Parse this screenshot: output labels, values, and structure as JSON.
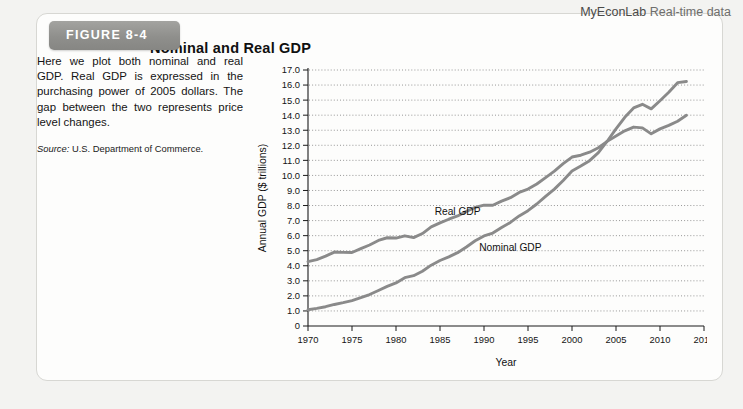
{
  "brand": {
    "name": "MyEconLab",
    "subtitle": "Real-time data"
  },
  "figure": {
    "badge_label": "FIGURE 8-4",
    "title": "Nominal and Real GDP",
    "caption": "Here we plot both nominal and real GDP. Real GDP is expressed in the purchasing power of 2005 dollars. The gap between the two represents price level changes.",
    "source_label": "Source:",
    "source_text": "U.S. Department of Commerce."
  },
  "ghost": {
    "line_a": "ttttttttttttt ttttttt tttttttt tttt ttttttt tttt ttttt ttttttt tttt tttttt",
    "line_b": "tttttt ttttt tt tttt ttttttt ttttt tttttttt tttt ttt tttttt ttttttt ttttt ttt tttt",
    "line_c": "Foreign Exchange Rates"
  },
  "chart_data": {
    "type": "line",
    "title": "Nominal and Real GDP",
    "xlabel": "Year",
    "ylabel": "Annual GDP ($ trillions)",
    "xlim": [
      1970,
      2015
    ],
    "ylim": [
      0,
      17
    ],
    "xticks": [
      1970,
      1975,
      1980,
      1985,
      1990,
      1995,
      2000,
      2005,
      2010,
      2015
    ],
    "yticks": [
      0,
      1.0,
      2.0,
      3.0,
      4.0,
      5.0,
      6.0,
      7.0,
      8.0,
      9.0,
      10.0,
      11.0,
      12.0,
      13.0,
      14.0,
      15.0,
      16.0,
      17.0
    ],
    "ytick_labels": [
      "0",
      "1.0",
      "2.0",
      "3.0",
      "4.0",
      "5.0",
      "6.0",
      "7.0",
      "8.0",
      "9.0",
      "10.0",
      "11.0",
      "12.0",
      "13.0",
      "14.0",
      "15.0",
      "16.0",
      "17.0"
    ],
    "grid": true,
    "grid_axis": "y",
    "legend": "inline-annotations",
    "line_color": "#8a8a8a",
    "x": [
      1970,
      1971,
      1972,
      1973,
      1974,
      1975,
      1976,
      1977,
      1978,
      1979,
      1980,
      1981,
      1982,
      1983,
      1984,
      1985,
      1986,
      1987,
      1988,
      1989,
      1990,
      1991,
      1992,
      1993,
      1994,
      1995,
      1996,
      1997,
      1998,
      1999,
      2000,
      2001,
      2002,
      2003,
      2004,
      2005,
      2006,
      2007,
      2008,
      2009,
      2010,
      2011,
      2012,
      2013
    ],
    "series": [
      {
        "name": "Real GDP",
        "label": "Real GDP",
        "label_x": 1987,
        "label_y": 7.4,
        "values": [
          4.27,
          4.41,
          4.64,
          4.91,
          4.89,
          4.88,
          5.14,
          5.38,
          5.68,
          5.86,
          5.84,
          5.99,
          5.87,
          6.14,
          6.58,
          6.85,
          7.09,
          7.31,
          7.61,
          7.88,
          8.03,
          8.02,
          8.29,
          8.52,
          8.87,
          9.09,
          9.43,
          9.85,
          10.28,
          10.78,
          11.22,
          11.34,
          11.54,
          11.84,
          12.26,
          12.62,
          12.96,
          13.21,
          13.16,
          12.76,
          13.09,
          13.32,
          13.6,
          13.99
        ]
      },
      {
        "name": "Nominal GDP",
        "label": "Nominal GDP",
        "label_x": 1993,
        "label_y": 5.0,
        "values": [
          1.08,
          1.17,
          1.28,
          1.43,
          1.55,
          1.69,
          1.88,
          2.09,
          2.36,
          2.63,
          2.86,
          3.21,
          3.34,
          3.64,
          4.04,
          4.35,
          4.59,
          4.87,
          5.25,
          5.66,
          5.98,
          6.17,
          6.54,
          6.88,
          7.31,
          7.66,
          8.1,
          8.61,
          9.09,
          9.66,
          10.29,
          10.62,
          10.98,
          11.51,
          12.27,
          13.09,
          13.86,
          14.48,
          14.72,
          14.42,
          14.96,
          15.52,
          16.16,
          16.24
        ]
      }
    ]
  }
}
